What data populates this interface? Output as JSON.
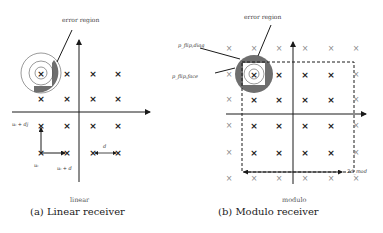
{
  "figure": {
    "panels": [
      {
        "id": "a",
        "caption": "(a) Linear receiver",
        "mode_label": "linear",
        "error_label": "error region",
        "labels": {
          "u_plus_dj": "uᵢ + dj",
          "u": "uᵢ",
          "u_plus_d": "uᵢ + d",
          "d": "d"
        }
      },
      {
        "id": "b",
        "caption": "(b) Modulo receiver",
        "mode_label": "modulo",
        "error_label": "error region",
        "labels": {
          "p_diag": "p_flip,diag",
          "p_face": "p_flip,face",
          "two_d_mod": "2d_mod"
        }
      }
    ],
    "colors": {
      "ink": "#1a1a1a",
      "error_fill": "#6e6e6e",
      "ghost_point": "#888888"
    }
  }
}
